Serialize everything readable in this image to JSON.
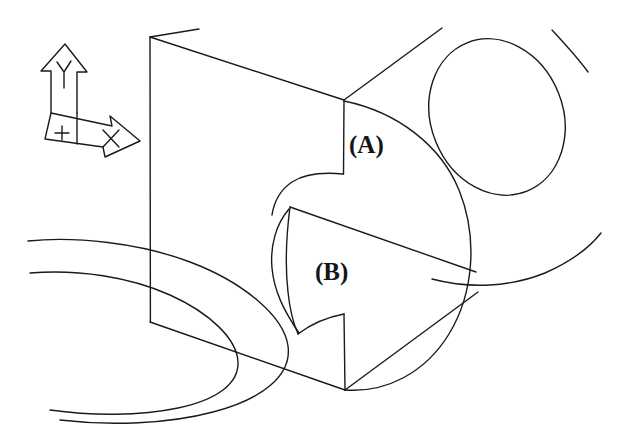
{
  "figure": {
    "kind": "engineering-isometric-sketch",
    "medium": "hand-drawn pencil line drawing, scanned",
    "background_color": "#ffffff",
    "ink_color": "#1a1a1a",
    "stroke_width_px": 1.4,
    "width_px": 627,
    "height_px": 444
  },
  "labels": {
    "a": "(A)",
    "b": "(B)"
  },
  "axis_indicator": {
    "y_axis_letter": "Y",
    "x_axis_letter": "X",
    "origin_marker": "+",
    "description": "block-arrow coordinate triad, Y pointing up, X pointing right-down"
  },
  "geometry": {
    "front_face": {
      "name": "front-vertical-face",
      "top_left": [
        150,
        37
      ],
      "bottom_left": [
        150,
        322
      ],
      "top_right": [
        343,
        100
      ],
      "note": "left vertical edge of the prism"
    },
    "cylinder": {
      "name": "large-cylindrical-boss",
      "center": [
        348,
        245
      ],
      "radius_x": 115,
      "radius_y": 150,
      "note": "large round body on the right of the block"
    },
    "hole": {
      "name": "elliptical-through-hole",
      "center": [
        497,
        117
      ],
      "radius_x": 66,
      "radius_y": 80,
      "rotation_deg": -22
    },
    "notch_a": {
      "name": "upper-notch",
      "note": "concave quarter-round cut below corner (343,100) near label (A)"
    },
    "notch_b": {
      "name": "lower-step",
      "note": "stepped face between (290,207) and (345,390) near label (B)"
    },
    "base_ellipses": {
      "name": "concentric-base-arcs",
      "count": 2,
      "center": [
        120,
        320
      ],
      "outer": [
        215,
        112
      ],
      "inner": [
        150,
        78
      ],
      "note": "two concentric ellipse arcs at lower-left, clipped by left image edge"
    }
  }
}
